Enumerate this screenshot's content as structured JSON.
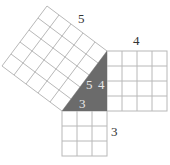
{
  "diagram": {
    "type": "pythagorean-theorem-squares",
    "colors": {
      "triangle_fill": "#6b6b6b",
      "grid_line": "#b8b8b8",
      "label": "#333333",
      "triangle_label": "#e8e8e8",
      "background": "#ffffff"
    },
    "triangle": {
      "vertices": [
        [
          62,
          111
        ],
        [
          107,
          111
        ],
        [
          107,
          51
        ]
      ],
      "labels": {
        "hypotenuse": "5",
        "vertical_leg": "4",
        "horizontal_leg": "3"
      }
    },
    "squares": [
      {
        "name": "hypotenuse-square",
        "side": 5,
        "label": "5"
      },
      {
        "name": "vertical-leg-square",
        "side": 4,
        "label": "4"
      },
      {
        "name": "horizontal-leg-square",
        "side": 3,
        "label": "3"
      }
    ]
  }
}
